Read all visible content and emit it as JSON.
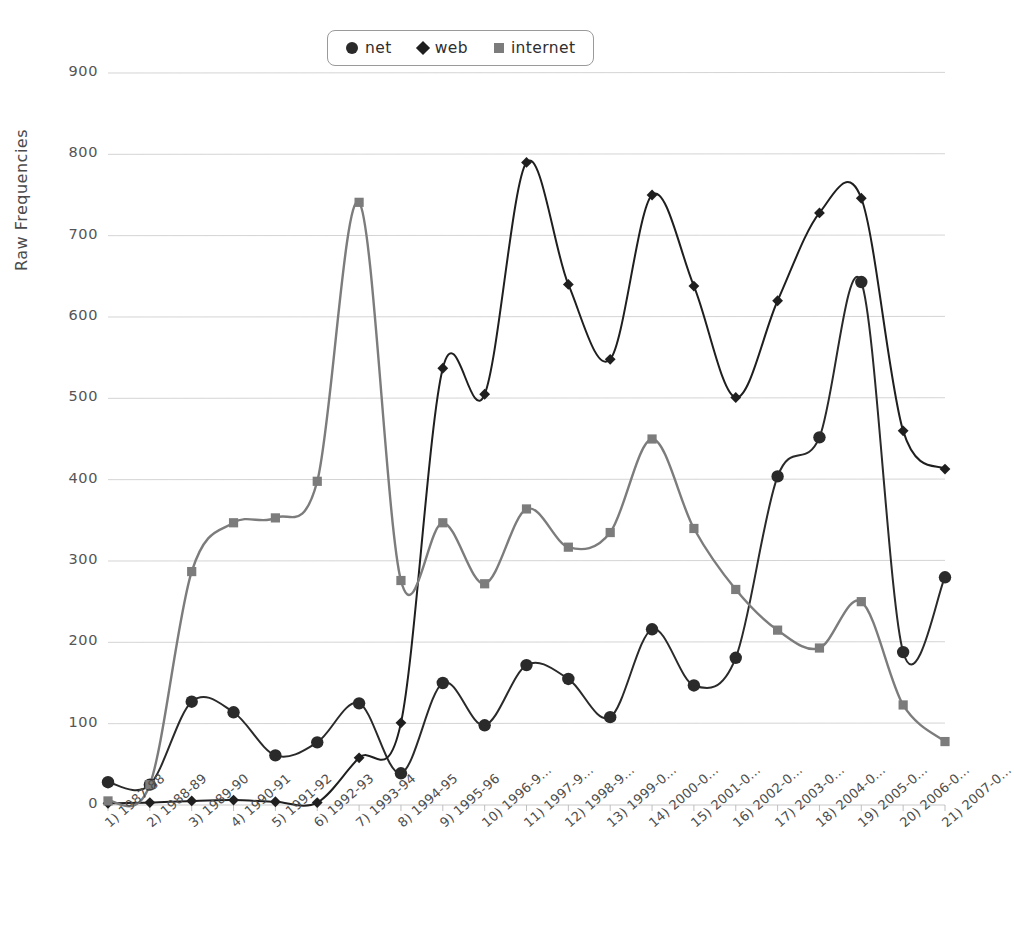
{
  "chart_data": {
    "type": "line",
    "title": "",
    "xlabel": "",
    "ylabel": "Raw Frequencies",
    "ylim": [
      0,
      900
    ],
    "ytick_step": 100,
    "yticks": [
      0,
      100,
      200,
      300,
      400,
      500,
      600,
      700,
      800,
      900
    ],
    "grid": true,
    "legend_position": "top-center",
    "categories": [
      "1) 1987-88",
      "2) 1988-89",
      "3) 1989-90",
      "4) 1990-91",
      "5) 1991-92",
      "6) 1992-93",
      "7) 1993-94",
      "8) 1994-95",
      "9) 1995-96",
      "10) 1996-9...",
      "11) 1997-9...",
      "12) 1998-9...",
      "13) 1999-0...",
      "14) 2000-0...",
      "15) 2001-0...",
      "16) 2002-0...",
      "17) 2003-0...",
      "18) 2004-0...",
      "19) 2005-0...",
      "20) 2006-0...",
      "21) 2007-0..."
    ],
    "series": [
      {
        "name": "net",
        "marker": "circle",
        "color": "#2a2a2a",
        "values": [
          28,
          25,
          127,
          114,
          61,
          77,
          125,
          39,
          150,
          98,
          172,
          155,
          108,
          216,
          147,
          181,
          404,
          452,
          643,
          188,
          280
        ]
      },
      {
        "name": "web",
        "marker": "diamond",
        "color": "#1f1f1f",
        "values": [
          2,
          3,
          5,
          6,
          4,
          3,
          58,
          101,
          537,
          505,
          790,
          640,
          548,
          750,
          638,
          501,
          620,
          728,
          746,
          460,
          413
        ]
      },
      {
        "name": "internet",
        "marker": "square",
        "color": "#7c7c7c",
        "values": [
          5,
          25,
          287,
          347,
          353,
          398,
          741,
          276,
          347,
          272,
          364,
          317,
          335,
          450,
          340,
          265,
          215,
          193,
          250,
          123,
          78
        ]
      }
    ]
  },
  "legend": {
    "entries": [
      {
        "label": "net",
        "marker": "circle-marker-icon"
      },
      {
        "label": "web",
        "marker": "diamond-marker-icon"
      },
      {
        "label": "internet",
        "marker": "square-marker-icon"
      }
    ]
  },
  "axes": {
    "y_title": "Raw Frequencies"
  },
  "colors": {
    "net": "#2a2a2a",
    "web": "#1f1f1f",
    "internet": "#7c7c7c",
    "grid": "#c9c9c9",
    "background": "#ffffff"
  }
}
